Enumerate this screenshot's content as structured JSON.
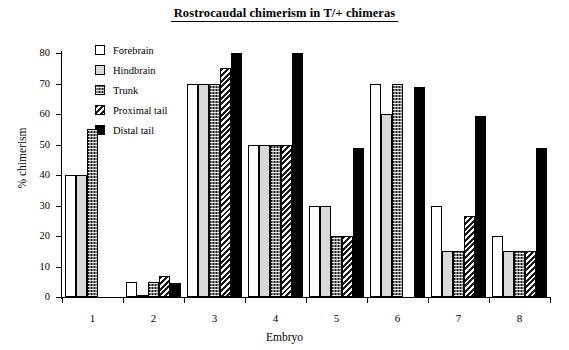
{
  "chart_data": {
    "type": "bar",
    "title": "Rostrocaudal chimerism in T/+ chimeras",
    "xlabel": "Embryo",
    "ylabel": "% chimerism",
    "ylim": [
      0,
      80
    ],
    "yticks": [
      0,
      10,
      20,
      30,
      40,
      50,
      60,
      70,
      80
    ],
    "grid": false,
    "legend_position": "top-left inside",
    "categories": [
      "1",
      "2",
      "3",
      "4",
      "5",
      "6",
      "7",
      "8"
    ],
    "series": [
      {
        "name": "Forebrain",
        "color": "#ffffff",
        "pattern": "empty",
        "values": [
          40,
          5,
          70,
          50,
          30,
          70,
          30,
          20
        ]
      },
      {
        "name": "Hindbrain",
        "color": "#d9d9d9",
        "pattern": "light-gray",
        "values": [
          40,
          0.5,
          70,
          50,
          30,
          60,
          15,
          15
        ]
      },
      {
        "name": "Trunk",
        "color": "#1d1d1d",
        "pattern": "checkered",
        "values": [
          55,
          5,
          70,
          50,
          20,
          70,
          15,
          15
        ]
      },
      {
        "name": "Proximal tail",
        "color": "#1a1a1a",
        "pattern": "diagonal-hatch",
        "values": [
          null,
          7,
          75,
          50,
          20,
          null,
          26.5,
          15
        ]
      },
      {
        "name": "Distal tail",
        "color": "#000000",
        "pattern": "solid",
        "values": [
          null,
          4.5,
          80,
          80,
          49,
          69,
          59.5,
          49
        ]
      }
    ]
  }
}
